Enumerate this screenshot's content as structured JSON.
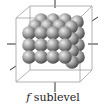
{
  "caption": {
    "sublevel_letter": "f",
    "sublevel_word": "sublevel"
  },
  "diagram": {
    "shape": "cube containing 3D cluster of spheres",
    "front_grid": {
      "columns": 4,
      "rows": 3
    },
    "depth_layers": 2,
    "colors": {
      "sphere_light": "#e6e6e6",
      "sphere_mid": "#9a9a9a",
      "sphere_dark": "#4a4a4a",
      "cube_edge": "#9a9a9a",
      "axis": "#333333"
    }
  }
}
